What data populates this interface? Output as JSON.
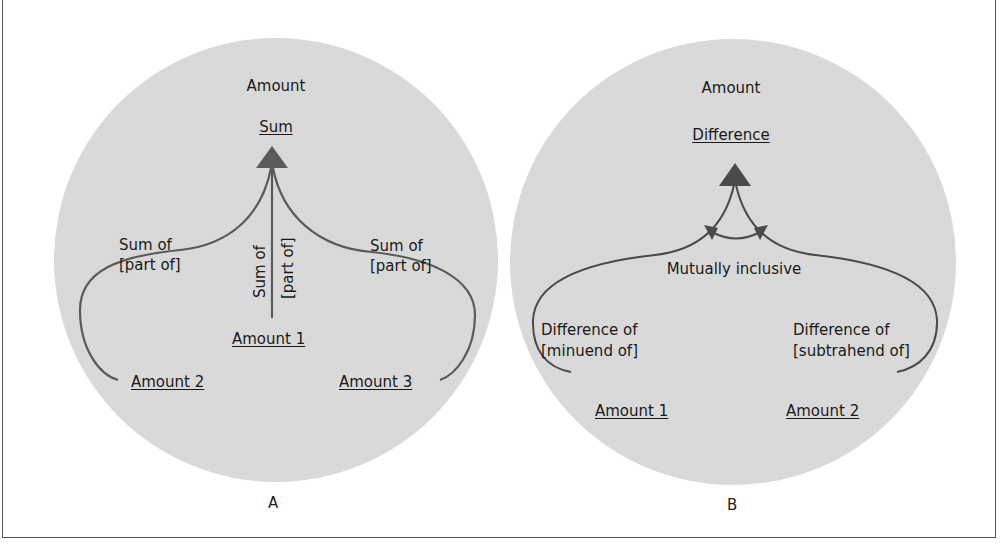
{
  "figure": {
    "panels": [
      {
        "id": "A",
        "label": "A",
        "title": "Amount",
        "result": "Sum",
        "relations": {
          "left": [
            "Sum of",
            "[part of]"
          ],
          "center": [
            "Sum of",
            "[part of]"
          ],
          "right": [
            "Sum of",
            "[part of]"
          ]
        },
        "inputs": [
          "Amount  1",
          "Amount 2",
          "Amount  3"
        ]
      },
      {
        "id": "B",
        "label": "B",
        "title": "Amount",
        "result": "Difference",
        "middle_note": "Mutually inclusive",
        "relations": {
          "left": [
            "Difference of",
            "[minuend of]"
          ],
          "right": [
            "Difference of",
            "[subtrahend of]"
          ]
        },
        "inputs": [
          "Amount 1",
          "Amount  2"
        ]
      }
    ],
    "colors": {
      "circle_fill": "#d9d9d9",
      "line": "#555555",
      "frame": "#555555"
    }
  }
}
